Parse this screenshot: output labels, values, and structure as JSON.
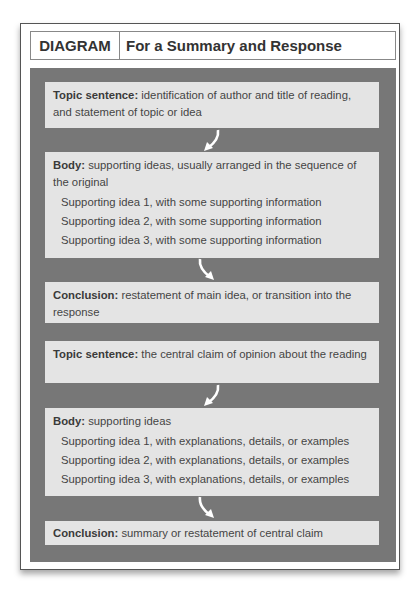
{
  "cutoff_text": "in parallel with the summary and response diagram",
  "header": {
    "tag": "DIAGRAM",
    "title": "For a Summary and Response"
  },
  "boxes": [
    {
      "label": "Topic sentence:",
      "text": "identification of author and title of reading, and statement of topic or idea",
      "items": []
    },
    {
      "label": "Body:",
      "text": "supporting ideas, usually arranged in the sequence of the original",
      "items": [
        "Supporting idea 1, with some supporting information",
        "Supporting idea 2, with some supporting information",
        "Supporting idea 3, with some supporting information"
      ]
    },
    {
      "label": "Conclusion:",
      "text": "restatement of main idea, or transition into the response",
      "items": []
    },
    {
      "label": "Topic sentence:",
      "text": "the central claim of opinion about the reading",
      "items": []
    },
    {
      "label": "Body:",
      "text": "supporting ideas",
      "items": [
        "Supporting idea 1, with explanations, details, or examples",
        "Supporting idea 2, with explanations, details, or examples",
        "Supporting idea 3, with explanations, details, or examples"
      ]
    },
    {
      "label": "Conclusion:",
      "text": "summary or restatement of central claim",
      "items": []
    }
  ],
  "arrows": [
    {
      "from": 0,
      "to": 1,
      "direction": "curve-down-left"
    },
    {
      "from": 1,
      "to": 2,
      "direction": "curve-down-right"
    },
    {
      "from": 3,
      "to": 4,
      "direction": "curve-down-left"
    },
    {
      "from": 4,
      "to": 5,
      "direction": "curve-down-right"
    }
  ],
  "colors": {
    "panel": "#777777",
    "box": "#e4e4e4",
    "arrow": "#ffffff"
  }
}
